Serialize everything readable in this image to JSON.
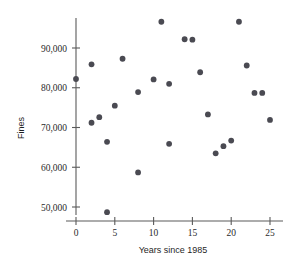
{
  "chart_data": {
    "type": "scatter",
    "title": "",
    "xlabel": "Years since 1985",
    "ylabel": "Fines",
    "xlim": [
      -1.5,
      26.5
    ],
    "ylim": [
      46500,
      98500
    ],
    "xticks": [
      0,
      5,
      10,
      15,
      20,
      25
    ],
    "xtick_labels": [
      "0",
      "5",
      "10",
      "15",
      "20",
      "25"
    ],
    "yticks": [
      50000,
      60000,
      70000,
      80000,
      90000
    ],
    "ytick_labels": [
      "50,000",
      "60,000",
      "70,000",
      "80,000",
      "90,000"
    ],
    "grid": false,
    "legend": null,
    "marker": "circle",
    "marker_color": "#4a4a52",
    "points": [
      {
        "x": 0,
        "y": 82200
      },
      {
        "x": 2,
        "y": 85900
      },
      {
        "x": 2,
        "y": 71200
      },
      {
        "x": 3,
        "y": 72600
      },
      {
        "x": 4,
        "y": 66400
      },
      {
        "x": 4,
        "y": 48700
      },
      {
        "x": 5,
        "y": 75500
      },
      {
        "x": 6,
        "y": 87300
      },
      {
        "x": 8,
        "y": 78900
      },
      {
        "x": 8,
        "y": 58700
      },
      {
        "x": 10,
        "y": 82100
      },
      {
        "x": 11,
        "y": 96600
      },
      {
        "x": 12,
        "y": 81000
      },
      {
        "x": 12,
        "y": 65900
      },
      {
        "x": 14,
        "y": 92200
      },
      {
        "x": 15,
        "y": 92100
      },
      {
        "x": 16,
        "y": 83900
      },
      {
        "x": 17,
        "y": 73300
      },
      {
        "x": 18,
        "y": 63500
      },
      {
        "x": 19,
        "y": 65300
      },
      {
        "x": 20,
        "y": 66700
      },
      {
        "x": 21,
        "y": 96600
      },
      {
        "x": 22,
        "y": 85600
      },
      {
        "x": 23,
        "y": 78700
      },
      {
        "x": 24,
        "y": 78700
      },
      {
        "x": 25,
        "y": 71900
      }
    ]
  },
  "axes": {
    "x_axis_name": "x-axis",
    "y_axis_name": "y-axis"
  }
}
